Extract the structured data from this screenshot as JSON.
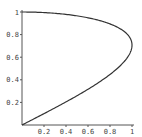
{
  "chart_data": {
    "type": "line",
    "title": "",
    "xlabel": "",
    "ylabel": "",
    "xlim": [
      0,
      1
    ],
    "ylim": [
      0,
      1
    ],
    "grid": false,
    "x_ticks": [
      "0.2",
      "0.4",
      "0.6",
      "0.8",
      "1"
    ],
    "y_ticks": [
      "0.2",
      "0.4",
      "0.6",
      "0.8",
      "1"
    ],
    "series": [
      {
        "name": "curve",
        "description": "parametric curve x = 2y*sqrt(1-y^2)",
        "x": [
          0,
          0.2,
          0.39,
          0.57,
          0.73,
          0.87,
          0.96,
          1.0,
          0.98,
          0.87,
          0.6,
          0.3,
          0
        ],
        "y": [
          0,
          0.1,
          0.2,
          0.3,
          0.4,
          0.5,
          0.6,
          0.707,
          0.8,
          0.9,
          0.95,
          0.99,
          1.0
        ]
      }
    ]
  }
}
